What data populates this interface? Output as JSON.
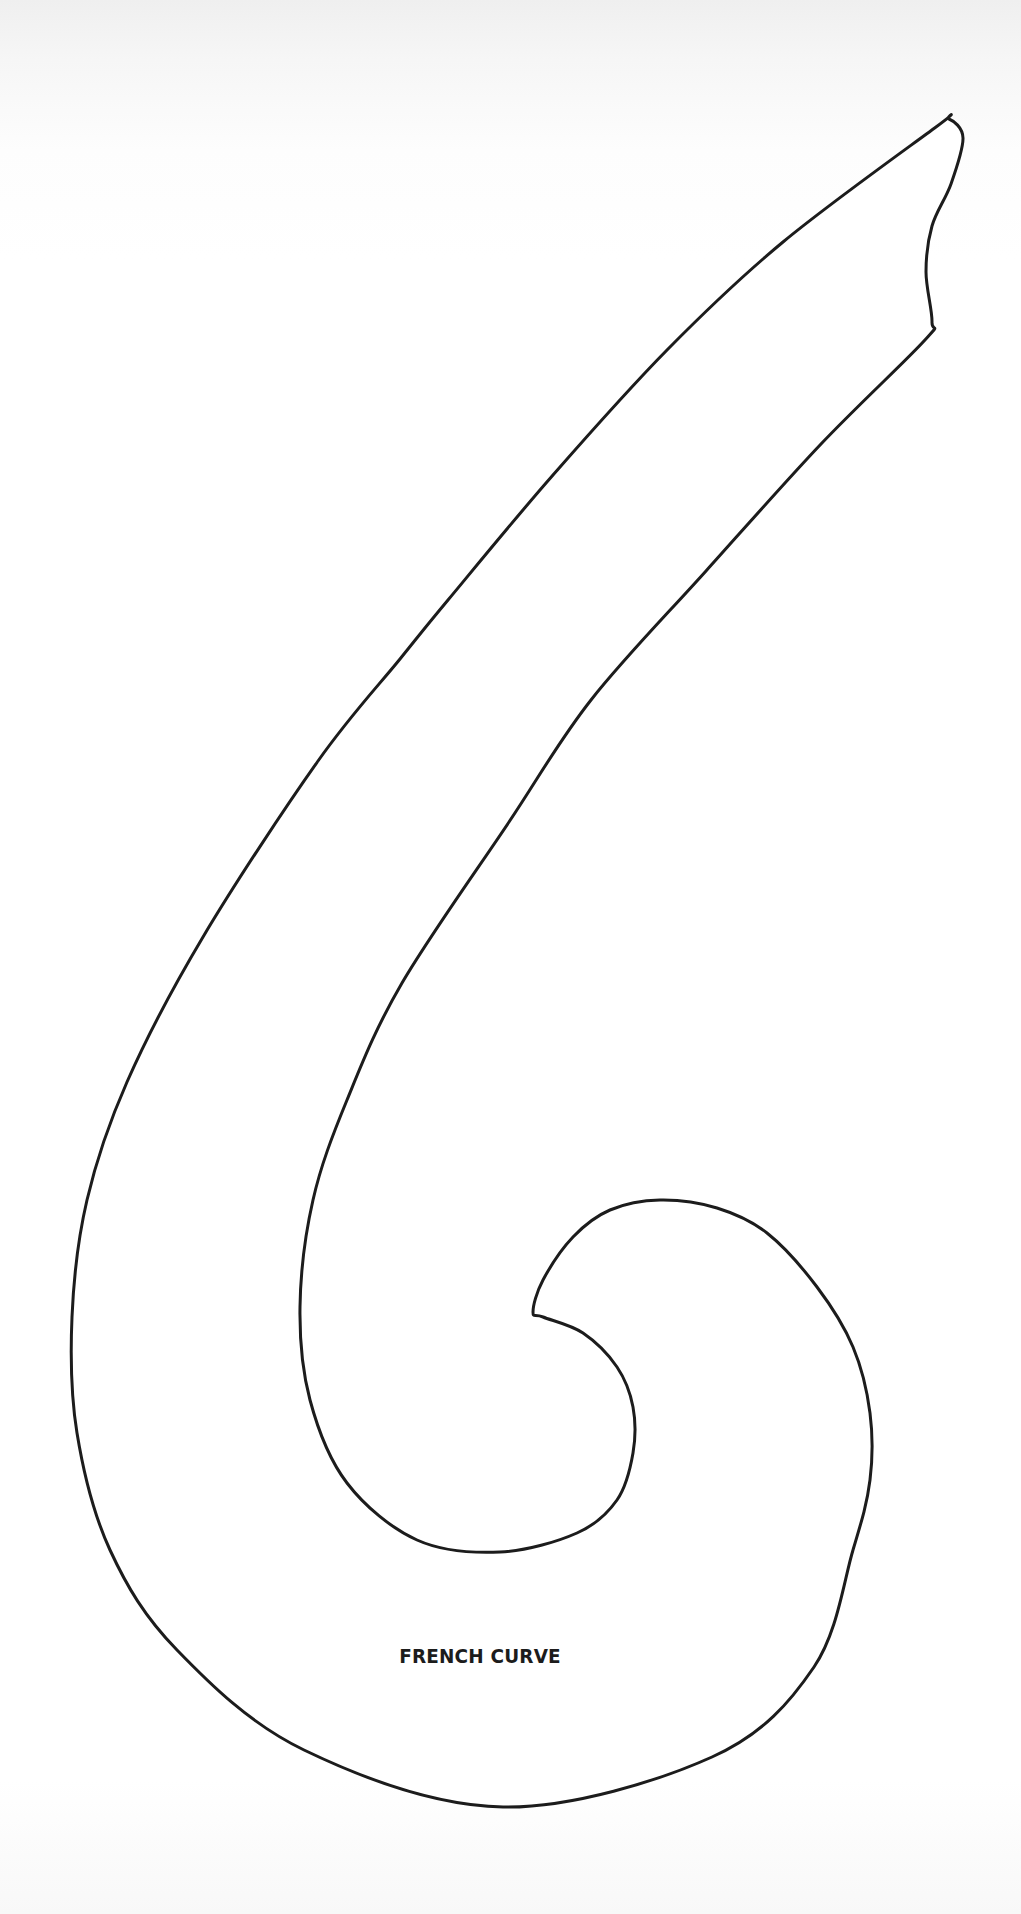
{
  "figure": {
    "title": "FRENCH CURVE",
    "shape": "french-curve-template-outline",
    "stroke_color": "#1c1c1c",
    "background_color": "#ffffff"
  }
}
